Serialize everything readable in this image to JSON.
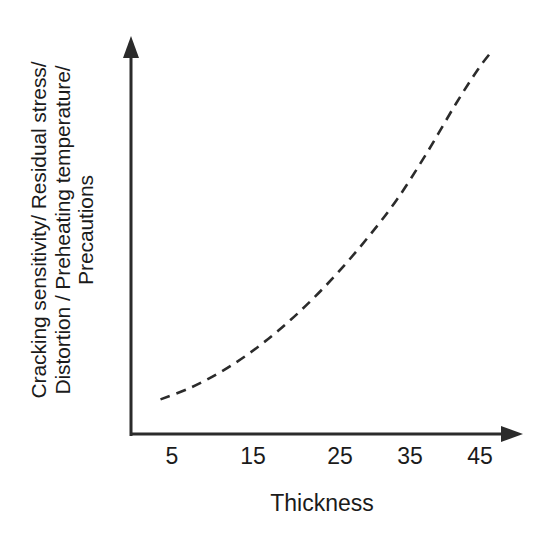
{
  "figure": {
    "background": "#ffffff",
    "ink": "#1b1b1b",
    "width": 556,
    "height": 537
  },
  "chart_data": {
    "type": "line",
    "title": "",
    "subtitle": "",
    "xlabel": "Thickness",
    "ylabel": "Cracking sensitivity/ Residual stress/ Distortion / Preheating temperature/ Precautions",
    "ylabel_lines": [
      "Cracking sensitivity/ Residual stress/",
      "Distortion / Preheating temperature/",
      "Precautions"
    ],
    "xticks": [
      5,
      15,
      25,
      35,
      45
    ],
    "xtick_labels": [
      "5",
      "15",
      "25",
      "35",
      "45"
    ],
    "xtick_px": [
      172,
      253,
      340,
      410,
      480
    ],
    "yticks": [],
    "ytick_labels": [],
    "xlim": [
      0,
      52
    ],
    "ylim": [
      0,
      1
    ],
    "grid": false,
    "legend": null,
    "legend_position": "none",
    "annotations": [],
    "axes_style": {
      "spines": "arrow-axes",
      "x_axis_arrow": true,
      "y_axis_arrow": true,
      "tick_marks": false
    },
    "series": [
      {
        "name": "Thickness effect",
        "linestyle": "dashed",
        "color": "#2b2b2b",
        "linewidth": 2.6,
        "dash_pattern": "10 7",
        "marker": "none",
        "x": [
          4,
          8,
          12,
          16,
          20,
          24,
          28,
          32,
          36,
          40,
          44,
          47,
          49
        ],
        "y": [
          0.09,
          0.12,
          0.16,
          0.21,
          0.27,
          0.34,
          0.42,
          0.51,
          0.61,
          0.73,
          0.86,
          0.95,
          1.0
        ],
        "note": "monotonic exponential rise"
      }
    ]
  }
}
